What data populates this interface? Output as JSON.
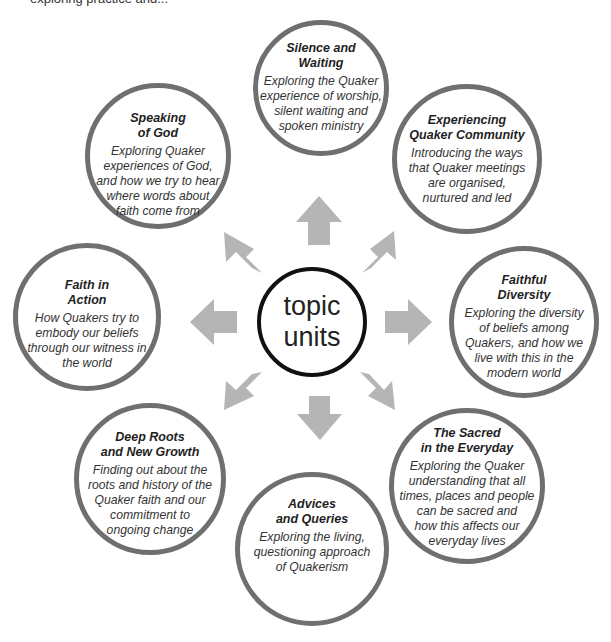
{
  "top_partial_text": "exploring practice and...",
  "center": {
    "line1": "topic",
    "line2": "units"
  },
  "colors": {
    "ring": "#6f6f6f",
    "arrow": "#b5b5b5",
    "center_ring": "#111111"
  },
  "units": [
    {
      "title1": "Silence and",
      "title2": "Waiting",
      "desc": [
        "Exploring the Quaker",
        "experience of worship,",
        "silent waiting and",
        "spoken ministry"
      ]
    },
    {
      "title1": "Speaking",
      "title2": "of God",
      "desc": [
        "Exploring Quaker",
        "experiences of God,",
        "and how we try to hear",
        "where words about",
        "faith come from"
      ]
    },
    {
      "title1": "Experiencing",
      "title2": "Quaker Community",
      "desc": [
        "Introducing the ways",
        "that Quaker meetings",
        "are organised,",
        "nurtured and led"
      ]
    },
    {
      "title1": "Faith in",
      "title2": "Action",
      "desc": [
        "How Quakers try to",
        "embody our beliefs",
        "through our witness in",
        "the world"
      ]
    },
    {
      "title1": "Faithful",
      "title2": "Diversity",
      "desc": [
        "Exploring the diversity",
        "of beliefs among",
        "Quakers, and how we",
        "live with this in the",
        "modern world"
      ]
    },
    {
      "title1": "Deep Roots",
      "title2": "and New Growth",
      "desc": [
        "Finding out about the",
        "roots and history of the",
        "Quaker faith and our",
        "commitment to",
        "ongoing change"
      ]
    },
    {
      "title1": "The Sacred",
      "title2": "in the Everyday",
      "desc": [
        "Exploring the Quaker",
        "understanding that all",
        "times, places and people",
        "can be sacred and",
        "how this affects our",
        "everyday lives"
      ]
    },
    {
      "title1": "Advices",
      "title2": "and Queries",
      "desc": [
        "Exploring the living,",
        "questioning approach",
        "of Quakerism"
      ]
    }
  ]
}
